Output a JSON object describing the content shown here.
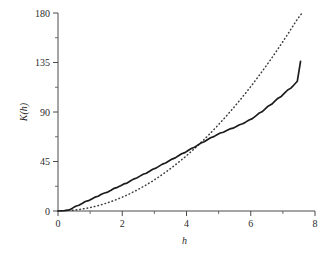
{
  "chart_data": {
    "type": "line",
    "title": "",
    "xlabel": "h",
    "ylabel": "K(h)",
    "xlim": [
      0,
      8
    ],
    "ylim": [
      0,
      180
    ],
    "grid": false,
    "legend": "none",
    "xticks": [
      0,
      2,
      4,
      6,
      8
    ],
    "xticklabels": [
      "0",
      "2",
      "4",
      "6",
      "8"
    ],
    "xminorticks": [
      1,
      3,
      5,
      7
    ],
    "yticks": [
      0,
      45,
      90,
      135,
      180
    ],
    "yticklabels": [
      "0",
      "45",
      "90",
      "135",
      "180"
    ],
    "yminorticks": [
      22.5,
      67.5,
      112.5,
      157.5
    ],
    "series": [
      {
        "name": "empirical K(h)",
        "style": "solid",
        "color": "#1c1c1c",
        "x": [
          0.0,
          0.2,
          0.35,
          0.45,
          0.55,
          0.65,
          0.75,
          0.85,
          0.95,
          1.05,
          1.15,
          1.25,
          1.35,
          1.45,
          1.55,
          1.65,
          1.75,
          1.85,
          1.95,
          2.05,
          2.15,
          2.25,
          2.35,
          2.45,
          2.55,
          2.65,
          2.75,
          2.85,
          2.95,
          3.05,
          3.15,
          3.25,
          3.35,
          3.45,
          3.55,
          3.65,
          3.75,
          3.85,
          3.95,
          4.05,
          4.15,
          4.25,
          4.35,
          4.45,
          4.55,
          4.65,
          4.75,
          4.85,
          4.95,
          5.05,
          5.15,
          5.25,
          5.35,
          5.45,
          5.55,
          5.65,
          5.75,
          5.85,
          5.95,
          6.05,
          6.15,
          6.25,
          6.35,
          6.45,
          6.55,
          6.65,
          6.75,
          6.85,
          6.95,
          7.05,
          7.15,
          7.25,
          7.35,
          7.45,
          7.55
        ],
        "y": [
          0.0,
          0.3,
          1.0,
          2.6,
          4.3,
          5.2,
          6.8,
          8.6,
          9.4,
          11.0,
          12.6,
          13.4,
          15.2,
          16.4,
          17.2,
          18.8,
          20.6,
          21.5,
          23.0,
          24.6,
          25.4,
          27.2,
          29.0,
          30.0,
          31.7,
          33.4,
          34.3,
          36.2,
          38.0,
          39.0,
          40.8,
          42.6,
          43.6,
          45.4,
          47.2,
          48.3,
          50.2,
          52.0,
          53.1,
          55.0,
          56.8,
          58.0,
          59.9,
          61.8,
          62.9,
          64.8,
          66.6,
          67.6,
          69.3,
          70.9,
          71.6,
          73.1,
          74.6,
          75.3,
          76.8,
          78.4,
          79.3,
          81.0,
          82.8,
          84.0,
          86.3,
          88.8,
          90.2,
          92.8,
          95.5,
          97.0,
          99.8,
          102.6,
          104.2,
          107.1,
          110.0,
          111.7,
          114.8,
          118.0,
          136.0
        ]
      },
      {
        "name": "theoretical K(h) = pi*h^2",
        "style": "dotted",
        "color": "#3a3a3a",
        "x": [
          0.45,
          0.7,
          0.95,
          1.2,
          1.45,
          1.7,
          1.95,
          2.2,
          2.45,
          2.7,
          2.95,
          3.2,
          3.45,
          3.7,
          3.95,
          4.2,
          4.45,
          4.7,
          4.95,
          5.2,
          5.45,
          5.7,
          5.95,
          6.2,
          6.45,
          6.7,
          6.95,
          7.2,
          7.45,
          7.6
        ],
        "y": [
          0.6,
          1.5,
          2.8,
          4.5,
          6.6,
          9.1,
          11.9,
          15.2,
          18.9,
          22.9,
          27.3,
          32.2,
          37.4,
          43.0,
          49.0,
          55.4,
          62.2,
          69.4,
          77.0,
          85.0,
          93.3,
          102.1,
          111.2,
          120.8,
          130.7,
          141.0,
          151.8,
          162.9,
          174.4,
          180.0
        ]
      }
    ]
  }
}
